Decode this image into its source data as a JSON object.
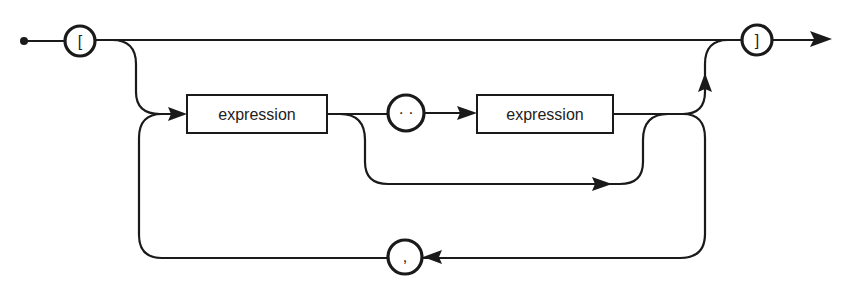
{
  "diagram": {
    "type": "syntax-diagram",
    "terminals": {
      "open_bracket": "[",
      "close_bracket": "]",
      "range": "· ·",
      "comma": ","
    },
    "nonterminals": {
      "first_expression": "expression",
      "second_expression": "expression"
    },
    "colors": {
      "ink": "#1a1a1a",
      "background": "#ffffff"
    },
    "paths": [
      "start → [ → ] → end (empty set)",
      "start → [ → expression → ] → end",
      "start → [ → expression → .. → expression → ] → end",
      "loop: after element → , → back to expression"
    ]
  }
}
